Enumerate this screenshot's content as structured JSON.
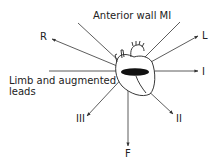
{
  "diagram": {
    "title": "Anterior wall MI",
    "caption_line1": "Limb and augmented",
    "caption_line2": "leads",
    "leads": {
      "R": "R",
      "L": "L",
      "I": "I",
      "II": "II",
      "III": "III",
      "F": "F"
    },
    "colors": {
      "line": "#333333",
      "infarct_region": "#111111"
    }
  }
}
